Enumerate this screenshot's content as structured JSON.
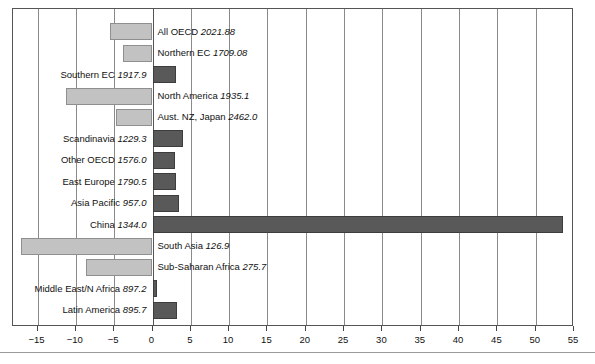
{
  "chart_data": {
    "type": "bar",
    "orientation": "horizontal",
    "title": "",
    "subtitle": "",
    "xlabel": "",
    "ylabel": "",
    "xlim": [
      -18.2,
      55.0
    ],
    "xticks": [
      -15,
      -10,
      -5,
      0,
      5,
      10,
      15,
      20,
      25,
      30,
      35,
      40,
      45,
      50,
      55
    ],
    "xtick_labels": [
      "−15",
      "−10",
      "−5",
      "0",
      "5",
      "10",
      "15",
      "20",
      "25",
      "30",
      "35",
      "40",
      "45",
      "50",
      "55"
    ],
    "grid": true,
    "grid_axis": "x",
    "legend": "none",
    "categories": [
      "All OECD",
      "Northern EC",
      "Southern EC",
      "North America",
      "Aust. NZ, Japan",
      "Scandinavia",
      "Other OECD",
      "East Europe",
      "Asia Pacific",
      "China",
      "South Asia",
      "Sub-Saharan Africa",
      "Middle East/N Africa",
      "Latin America"
    ],
    "values": [
      -5.6,
      -3.8,
      3.1,
      -11.3,
      -4.8,
      4.0,
      2.9,
      3.1,
      3.4,
      53.5,
      -17.1,
      -8.7,
      0.6,
      3.2
    ],
    "annotations": [
      "2021.88",
      "1709.08",
      "1917.9",
      "1935.1",
      "2462.0",
      "1229.3",
      "1576.0",
      "1790.5",
      "957.0",
      "1344.0",
      "126.9",
      "275.7",
      "897.2",
      "895.7"
    ],
    "colors": {
      "positive": "#595959",
      "negative": "#c2c2c2",
      "border": "#5a5a5a",
      "grid": "#8a8a8a",
      "frame": "#555555",
      "axis_text": "#111111"
    }
  },
  "bars": [
    {
      "name": "All OECD",
      "value": "2021.88",
      "label": "All OECD",
      "annotation": "2021.88"
    },
    {
      "name": "Northern EC",
      "value": "1709.08",
      "label": "Northern EC",
      "annotation": "1709.08"
    },
    {
      "name": "Southern EC",
      "value": "1917.9",
      "label": "Southern EC",
      "annotation": "1917.9"
    },
    {
      "name": "North America",
      "value": "1935.1",
      "label": "North America",
      "annotation": "1935.1"
    },
    {
      "name": "Aust. NZ, Japan",
      "value": "2462.0",
      "label": "Aust. NZ, Japan",
      "annotation": "2462.0"
    },
    {
      "name": "Scandinavia",
      "value": "1229.3",
      "label": "Scandinavia",
      "annotation": "1229.3"
    },
    {
      "name": "Other OECD",
      "value": "1576.0",
      "label": "Other OECD",
      "annotation": "1576.0"
    },
    {
      "name": "East Europe",
      "value": "1790.5",
      "label": "East Europe",
      "annotation": "1790.5"
    },
    {
      "name": "Asia Pacific",
      "value": "957.0",
      "label": "Asia Pacific",
      "annotation": "957.0"
    },
    {
      "name": "China",
      "value": "1344.0",
      "label": "China",
      "annotation": "1344.0"
    },
    {
      "name": "South Asia",
      "value": "126.9",
      "label": "South Asia",
      "annotation": "126.9"
    },
    {
      "name": "Sub-Saharan Africa",
      "value": "275.7",
      "label": "Sub-Saharan Africa",
      "annotation": "275.7"
    },
    {
      "name": "Middle East/N Africa",
      "value": "897.2",
      "label": "Middle East/N Africa",
      "annotation": "897.2"
    },
    {
      "name": "Latin America",
      "value": "895.7",
      "label": "Latin America",
      "annotation": "895.7"
    }
  ]
}
